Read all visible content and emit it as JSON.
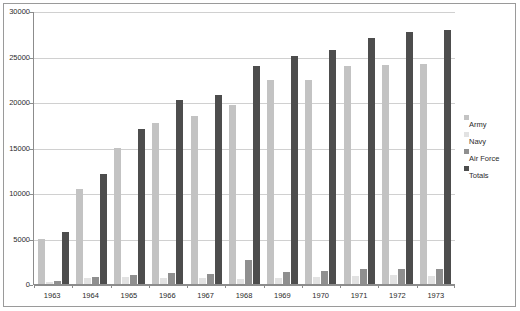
{
  "chart_data": {
    "type": "bar",
    "title": "",
    "subtitle": "",
    "xlabel": "",
    "ylabel": "",
    "categories": [
      "1963",
      "1964",
      "1965",
      "1966",
      "1967",
      "1968",
      "1969",
      "1970",
      "1971",
      "1972",
      "1973"
    ],
    "ylim": [
      0,
      30000
    ],
    "ytick_labels": [
      "30000",
      "25000",
      "20000",
      "15000",
      "10000",
      "5000",
      "0"
    ],
    "ytick_values": [
      30000,
      25000,
      20000,
      15000,
      10000,
      5000,
      0
    ],
    "grid": true,
    "legend_position": "right",
    "series": [
      {
        "name": "Army",
        "color": "#c3c3c3",
        "values": [
          5000,
          10400,
          14900,
          17700,
          18500,
          19700,
          22400,
          22400,
          24000,
          24100,
          24200
        ]
      },
      {
        "name": "Navy",
        "color": "#e2e2e2",
        "values": [
          200,
          700,
          800,
          700,
          700,
          600,
          700,
          800,
          900,
          1000,
          900
        ]
      },
      {
        "name": "Air Force",
        "color": "#8f8f8f",
        "values": [
          350,
          750,
          1000,
          1200,
          1150,
          2600,
          1300,
          1450,
          1600,
          1700,
          1600
        ]
      },
      {
        "name": "Totals",
        "color": "#4d4d4d",
        "values": [
          5700,
          12100,
          17000,
          20200,
          20800,
          24000,
          25100,
          25700,
          27000,
          27700,
          27900
        ]
      }
    ]
  },
  "legend": {
    "items": [
      {
        "label": "Army"
      },
      {
        "label": "Navy"
      },
      {
        "label": "Air Force"
      },
      {
        "label": "Totals"
      }
    ]
  }
}
